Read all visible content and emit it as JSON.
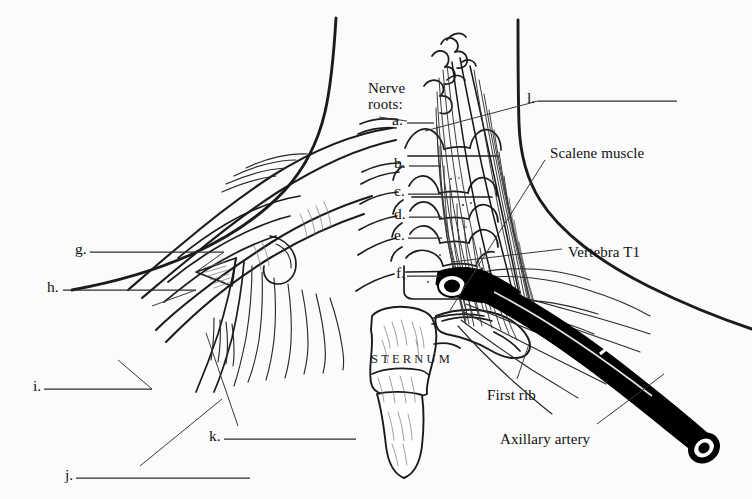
{
  "figure": {
    "background_color": "#fbfbfb",
    "ink_color": "#1a1a1a",
    "width": 752,
    "height": 499
  },
  "headings": {
    "nerve_roots": "Nerve\nroots:",
    "nerve_roots_line1": "Nerve",
    "nerve_roots_line2": "roots:"
  },
  "named_labels": [
    {
      "id": "scalene-muscle",
      "text": "Scalene muscle",
      "x": 550,
      "y": 145
    },
    {
      "id": "vertebra-t1",
      "text": "Vertebra T1",
      "x": 568,
      "y": 244
    },
    {
      "id": "first-rib",
      "text": "First rib",
      "x": 487,
      "y": 387
    },
    {
      "id": "axillary-artery",
      "text": "Axillary artery",
      "x": 500,
      "y": 431
    },
    {
      "id": "sternum",
      "text": "STERNUM",
      "x": 371,
      "y": 352
    }
  ],
  "blank_labels": [
    {
      "letter": "a.",
      "x": 392,
      "y": 111,
      "line_x1": 407,
      "line_x2": 434,
      "line_y": 123
    },
    {
      "letter": "b.",
      "x": 394,
      "y": 154,
      "line_x1": 409,
      "line_x2": 441,
      "line_y": 166
    },
    {
      "letter": "c.",
      "x": 394,
      "y": 182,
      "line_x1": 408,
      "line_x2": 442,
      "line_y": 194
    },
    {
      "letter": "d.",
      "x": 394,
      "y": 205,
      "line_x1": 409,
      "line_x2": 442,
      "line_y": 217
    },
    {
      "letter": "e.",
      "x": 394,
      "y": 226,
      "line_x1": 408,
      "line_x2": 442,
      "line_y": 238
    },
    {
      "letter": "f.",
      "x": 396,
      "y": 264,
      "line_x1": 407,
      "line_x2": 441,
      "line_y": 276
    },
    {
      "letter": "g.",
      "x": 75,
      "y": 240,
      "line_x1": 90,
      "line_x2": 224,
      "line_y": 252
    },
    {
      "letter": "h.",
      "x": 47,
      "y": 278,
      "line_x1": 63,
      "line_x2": 196,
      "line_y": 290
    },
    {
      "letter": "i.",
      "x": 33,
      "y": 377,
      "line_x1": 44,
      "line_x2": 152,
      "line_y": 389
    },
    {
      "letter": "j.",
      "x": 65,
      "y": 467,
      "line_x1": 76,
      "line_x2": 250,
      "line_y": 478
    },
    {
      "letter": "k.",
      "x": 209,
      "y": 428,
      "line_x1": 224,
      "line_x2": 356,
      "line_y": 439
    },
    {
      "letter": "l.",
      "x": 527,
      "y": 89,
      "line_x1": 538,
      "line_x2": 677,
      "line_y": 101
    }
  ],
  "leader_lines": [
    {
      "from": "a.",
      "x1": 407,
      "y1": 123,
      "x2": 380,
      "y2": 118
    },
    {
      "from": "g.",
      "x1": 224,
      "y1": 252,
      "x2": 196,
      "y2": 272
    },
    {
      "from": "h.",
      "x1": 196,
      "y1": 290,
      "x2": 153,
      "y2": 305
    },
    {
      "from": "i.",
      "x1": 152,
      "y1": 389,
      "x2": 118,
      "y2": 360
    },
    {
      "from": "j.",
      "x1": 140,
      "y1": 466,
      "x2": 222,
      "y2": 399
    },
    {
      "from": "k.",
      "x1": 238,
      "y1": 426,
      "x2": 206,
      "y2": 333
    },
    {
      "from": "l.",
      "x1": 538,
      "y1": 101,
      "x2": 425,
      "y2": 131
    },
    {
      "from": "scalene-muscle",
      "x1": 544,
      "y1": 160,
      "x2": 449,
      "y2": 310
    },
    {
      "from": "vertebra-t1",
      "x1": 562,
      "y1": 249,
      "x2": 452,
      "y2": 261
    },
    {
      "from": "first-rib",
      "x1": 517,
      "y1": 380,
      "x2": 528,
      "y2": 345
    },
    {
      "from": "axillary-artery",
      "x1": 596,
      "y1": 424,
      "x2": 664,
      "y2": 375
    }
  ],
  "answer_key_present": false
}
